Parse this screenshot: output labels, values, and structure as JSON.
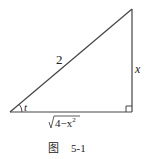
{
  "figure": {
    "hypotenuse_label": "2",
    "opposite_label": "x",
    "angle_label": "t",
    "adjacent_label_radicand": "4−x",
    "adjacent_label_exponent": "2",
    "caption_prefix": "图",
    "caption_number": "5-1"
  },
  "colors": {
    "line": "#333333",
    "text": "#222222"
  }
}
